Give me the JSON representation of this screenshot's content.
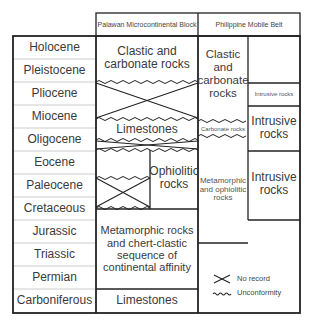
{
  "headers": {
    "palawan": "Palawan Microcontinental Block",
    "philippine": "Philippine Mobile Belt"
  },
  "periods": [
    "Holocene",
    "Pleistocene",
    "Pliocene",
    "Miocene",
    "Oligocene",
    "Eocene",
    "Paleocene",
    "Cretaceous",
    "Jurassic",
    "Triassic",
    "Permian",
    "Carboniferous"
  ],
  "palawan": {
    "clastic": "Clastic and carbonate  rocks",
    "limestones_upper": "Limestones",
    "ophiolitic": "Ophiolitic rocks",
    "metamorphic": "Metamorphic rocks and chert-clastic sequence of continental affinity",
    "limestones_lower": "Limestones"
  },
  "philippine": {
    "clastic": "Clastic and carbonate rocks",
    "carbonate": "Carbonate rocks",
    "metamorphic": "Metamorphic and ophiolitic rocks",
    "intrusive_small": "Intrusive rocks",
    "intrusive_1": "Intrusive rocks",
    "intrusive_2": "Intrusive rocks"
  },
  "legend": {
    "no_record": "No record",
    "unconformity": "Unconformity"
  }
}
